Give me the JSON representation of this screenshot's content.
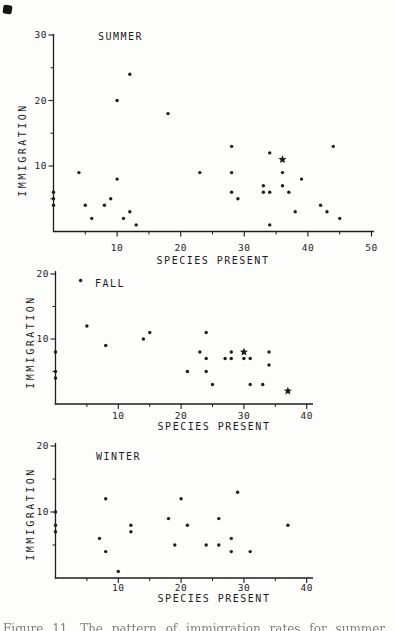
{
  "figure": {
    "ink_color": "#1c1c1c",
    "caption_fragment": "Figure 11.  The pattern of immigration rates for summer, fall, and winter seasons"
  },
  "chart_data": [
    {
      "type": "scatter",
      "title": "SUMMER",
      "xlabel": "SPECIES PRESENT",
      "ylabel": "IMMIGRATION",
      "xlim": [
        0,
        50
      ],
      "ylim": [
        0,
        30
      ],
      "grid": false,
      "x_major_ticks": [
        10,
        20,
        30,
        40,
        50
      ],
      "x_minor_ticks": [
        5,
        15,
        25,
        35,
        45
      ],
      "y_major_ticks": [
        10,
        20,
        30
      ],
      "y_minor_ticks": [
        5,
        15,
        25
      ],
      "points": [
        [
          0,
          6
        ],
        [
          0,
          5
        ],
        [
          0,
          4
        ],
        [
          4,
          9
        ],
        [
          5,
          4
        ],
        [
          6,
          2
        ],
        [
          8,
          4
        ],
        [
          9,
          5
        ],
        [
          10,
          20
        ],
        [
          10,
          8
        ],
        [
          11,
          2
        ],
        [
          12,
          24
        ],
        [
          12,
          3
        ],
        [
          13,
          1
        ],
        [
          18,
          18
        ],
        [
          23,
          9
        ],
        [
          28,
          13
        ],
        [
          28,
          9
        ],
        [
          28,
          6
        ],
        [
          29,
          5
        ],
        [
          33,
          7
        ],
        [
          33,
          6
        ],
        [
          34,
          12
        ],
        [
          34,
          6
        ],
        [
          34,
          1
        ],
        [
          36,
          9
        ],
        [
          36,
          7
        ],
        [
          37,
          6
        ],
        [
          38,
          3
        ],
        [
          39,
          8
        ],
        [
          42,
          4
        ],
        [
          43,
          3
        ],
        [
          44,
          13
        ],
        [
          45,
          2
        ]
      ],
      "star_points": [
        [
          36,
          11
        ]
      ]
    },
    {
      "type": "scatter",
      "title": "FALL",
      "xlabel": "SPECIES PRESENT",
      "ylabel": "IMMIGRATION",
      "xlim": [
        0,
        40
      ],
      "ylim": [
        0,
        20
      ],
      "grid": false,
      "x_major_ticks": [
        10,
        20,
        30,
        40
      ],
      "x_minor_ticks": [
        5,
        15,
        25,
        35
      ],
      "y_major_ticks": [
        10,
        20
      ],
      "y_minor_ticks": [
        5,
        15
      ],
      "points": [
        [
          0,
          8
        ],
        [
          0,
          5
        ],
        [
          0,
          4
        ],
        [
          4,
          19
        ],
        [
          5,
          12
        ],
        [
          8,
          9
        ],
        [
          14,
          10
        ],
        [
          15,
          11
        ],
        [
          21,
          5
        ],
        [
          23,
          8
        ],
        [
          24,
          11
        ],
        [
          24,
          7
        ],
        [
          24,
          5
        ],
        [
          25,
          3
        ],
        [
          27,
          7
        ],
        [
          28,
          8
        ],
        [
          28,
          7
        ],
        [
          30,
          7
        ],
        [
          31,
          7
        ],
        [
          31,
          3
        ],
        [
          33,
          3
        ],
        [
          34,
          8
        ],
        [
          34,
          6
        ]
      ],
      "star_points": [
        [
          30,
          8
        ],
        [
          37,
          2
        ]
      ]
    },
    {
      "type": "scatter",
      "title": "WINTER",
      "xlabel": "SPECIES PRESENT",
      "ylabel": "IMMIGRATION",
      "xlim": [
        0,
        40
      ],
      "ylim": [
        0,
        20
      ],
      "grid": false,
      "x_major_ticks": [
        10,
        20,
        30,
        40
      ],
      "x_minor_ticks": [
        5,
        15,
        25,
        35
      ],
      "y_major_ticks": [
        10,
        20
      ],
      "y_minor_ticks": [
        5,
        15
      ],
      "points": [
        [
          0,
          10
        ],
        [
          0,
          8
        ],
        [
          0,
          7
        ],
        [
          7,
          6
        ],
        [
          8,
          12
        ],
        [
          8,
          4
        ],
        [
          10,
          1
        ],
        [
          12,
          8
        ],
        [
          12,
          7
        ],
        [
          18,
          9
        ],
        [
          19,
          5
        ],
        [
          20,
          12
        ],
        [
          21,
          8
        ],
        [
          24,
          5
        ],
        [
          26,
          9
        ],
        [
          26,
          5
        ],
        [
          28,
          6
        ],
        [
          28,
          4
        ],
        [
          29,
          13
        ],
        [
          31,
          4
        ],
        [
          37,
          8
        ]
      ],
      "star_points": []
    }
  ]
}
